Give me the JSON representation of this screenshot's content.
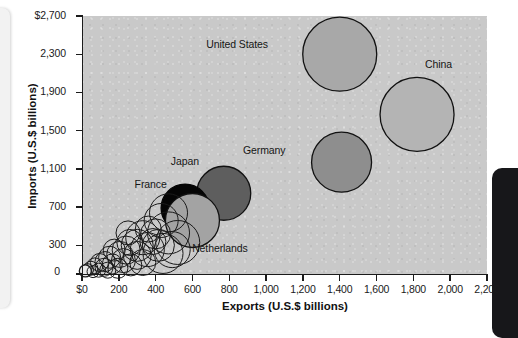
{
  "figure": {
    "plot_background_color": "#c9c9c9",
    "axis_color": "#1b1b1b"
  },
  "chart_data": {
    "type": "scatter",
    "variant": "bubble",
    "title": "",
    "xlabel": "Exports (U.S.$ billions)",
    "ylabel": "Imports (U.S.$ billions)",
    "xlim": [
      0,
      2200
    ],
    "ylim": [
      0,
      2700
    ],
    "grid": false,
    "legend": "none",
    "xticks": [
      0,
      200,
      400,
      600,
      800,
      1000,
      1200,
      1400,
      1600,
      1800,
      2000,
      2200
    ],
    "xtick_labels": [
      "$0",
      "200",
      "400",
      "600",
      "800",
      "1,000",
      "1,200",
      "1,400",
      "1,600",
      "1,800",
      "2,000",
      "2,200"
    ],
    "yticks": [
      0,
      300,
      700,
      1100,
      1500,
      1900,
      2300,
      2700
    ],
    "ytick_labels": [
      "0",
      "300",
      "700",
      "1,100",
      "1,500",
      "1,900",
      "2,300",
      "$2,700"
    ],
    "annotations": [
      {
        "text": "United States",
        "x": 1010,
        "y": 2400
      },
      {
        "text": "China",
        "x": 2010,
        "y": 2190
      },
      {
        "text": "Germany",
        "x": 1105,
        "y": 1290
      },
      {
        "text": "Japan",
        "x": 635,
        "y": 1175
      },
      {
        "text": "France",
        "x": 460,
        "y": 935
      },
      {
        "text": "Netherlands",
        "x": 900,
        "y": 265
      }
    ],
    "points": [
      {
        "name": "United States",
        "x": 1400,
        "y": 2300,
        "r": 37,
        "fill": "#a8a8a8",
        "stroke": "#111111"
      },
      {
        "name": "China",
        "x": 1820,
        "y": 1670,
        "r": 37,
        "fill": "#b4b4b4",
        "stroke": "#111111"
      },
      {
        "name": "Germany",
        "x": 1410,
        "y": 1170,
        "r": 30,
        "fill": "#8e8e8e",
        "stroke": "#111111"
      },
      {
        "name": "Japan",
        "x": 770,
        "y": 845,
        "r": 27,
        "fill": "#5e5e5e",
        "stroke": "#111111"
      },
      {
        "name": "France",
        "x": 560,
        "y": 690,
        "r": 24,
        "fill": "#050505",
        "stroke": "#050505"
      },
      {
        "name": "Netherlands",
        "x": 600,
        "y": 560,
        "r": 27,
        "fill": "#a3a3a3",
        "stroke": "#111111"
      },
      {
        "name": "other-01",
        "x": 470,
        "y": 640,
        "r": 19,
        "fill": "none",
        "stroke": "#1a1a1a"
      },
      {
        "name": "other-02",
        "x": 430,
        "y": 560,
        "r": 17,
        "fill": "none",
        "stroke": "#1a1a1a"
      },
      {
        "name": "other-03",
        "x": 470,
        "y": 430,
        "r": 21,
        "fill": "none",
        "stroke": "#1a1a1a"
      },
      {
        "name": "other-04",
        "x": 520,
        "y": 330,
        "r": 22,
        "fill": "none",
        "stroke": "#1a1a1a"
      },
      {
        "name": "other-05",
        "x": 400,
        "y": 420,
        "r": 15,
        "fill": "none",
        "stroke": "#1a1a1a"
      },
      {
        "name": "other-06",
        "x": 360,
        "y": 470,
        "r": 13,
        "fill": "none",
        "stroke": "#1a1a1a"
      },
      {
        "name": "other-07",
        "x": 330,
        "y": 380,
        "r": 17,
        "fill": "none",
        "stroke": "#1a1a1a"
      },
      {
        "name": "other-08",
        "x": 300,
        "y": 300,
        "r": 16,
        "fill": "none",
        "stroke": "#1a1a1a"
      },
      {
        "name": "other-09",
        "x": 260,
        "y": 330,
        "r": 13,
        "fill": "none",
        "stroke": "#1a1a1a"
      },
      {
        "name": "other-10",
        "x": 240,
        "y": 250,
        "r": 14,
        "fill": "none",
        "stroke": "#1a1a1a"
      },
      {
        "name": "other-11",
        "x": 205,
        "y": 205,
        "r": 13,
        "fill": "none",
        "stroke": "#1a1a1a"
      },
      {
        "name": "other-12",
        "x": 175,
        "y": 250,
        "r": 11,
        "fill": "none",
        "stroke": "#1a1a1a"
      },
      {
        "name": "other-13",
        "x": 150,
        "y": 175,
        "r": 11,
        "fill": "none",
        "stroke": "#1a1a1a"
      },
      {
        "name": "other-14",
        "x": 125,
        "y": 130,
        "r": 10,
        "fill": "none",
        "stroke": "#1a1a1a"
      },
      {
        "name": "other-15",
        "x": 95,
        "y": 120,
        "r": 9,
        "fill": "none",
        "stroke": "#1a1a1a"
      },
      {
        "name": "other-16",
        "x": 70,
        "y": 85,
        "r": 8,
        "fill": "none",
        "stroke": "#1a1a1a"
      },
      {
        "name": "other-17",
        "x": 48,
        "y": 60,
        "r": 7,
        "fill": "none",
        "stroke": "#1a1a1a"
      },
      {
        "name": "other-18",
        "x": 30,
        "y": 45,
        "r": 6,
        "fill": "none",
        "stroke": "#1a1a1a"
      },
      {
        "name": "other-19",
        "x": 18,
        "y": 32,
        "r": 6,
        "fill": "#e8e8e8",
        "stroke": "#1a1a1a"
      },
      {
        "name": "other-20",
        "x": 355,
        "y": 255,
        "r": 17,
        "fill": "none",
        "stroke": "#1a1a1a"
      },
      {
        "name": "other-21",
        "x": 300,
        "y": 195,
        "r": 14,
        "fill": "none",
        "stroke": "#1a1a1a"
      },
      {
        "name": "other-22",
        "x": 225,
        "y": 140,
        "r": 12,
        "fill": "none",
        "stroke": "#1a1a1a"
      },
      {
        "name": "other-23",
        "x": 165,
        "y": 105,
        "r": 10,
        "fill": "none",
        "stroke": "#1a1a1a"
      },
      {
        "name": "other-24",
        "x": 120,
        "y": 70,
        "r": 9,
        "fill": "none",
        "stroke": "#1a1a1a"
      },
      {
        "name": "other-25",
        "x": 415,
        "y": 300,
        "r": 16,
        "fill": "none",
        "stroke": "#1a1a1a"
      },
      {
        "name": "other-26",
        "x": 385,
        "y": 340,
        "r": 13,
        "fill": "none",
        "stroke": "#1a1a1a"
      },
      {
        "name": "other-27",
        "x": 440,
        "y": 215,
        "r": 20,
        "fill": "none",
        "stroke": "#1a1a1a"
      },
      {
        "name": "other-28",
        "x": 330,
        "y": 120,
        "r": 13,
        "fill": "none",
        "stroke": "#1a1a1a"
      },
      {
        "name": "other-29",
        "x": 265,
        "y": 95,
        "r": 11,
        "fill": "none",
        "stroke": "#1a1a1a"
      },
      {
        "name": "other-30",
        "x": 195,
        "y": 60,
        "r": 10,
        "fill": "none",
        "stroke": "#1a1a1a"
      },
      {
        "name": "other-31",
        "x": 140,
        "y": 40,
        "r": 8,
        "fill": "none",
        "stroke": "#1a1a1a"
      },
      {
        "name": "other-32",
        "x": 90,
        "y": 40,
        "r": 7,
        "fill": "none",
        "stroke": "#1a1a1a"
      },
      {
        "name": "other-33",
        "x": 60,
        "y": 25,
        "r": 6,
        "fill": "none",
        "stroke": "#1a1a1a"
      },
      {
        "name": "other-34",
        "x": 490,
        "y": 255,
        "r": 18,
        "fill": "none",
        "stroke": "#1a1a1a"
      },
      {
        "name": "other-35",
        "x": 250,
        "y": 430,
        "r": 12,
        "fill": "none",
        "stroke": "#1a1a1a"
      }
    ]
  }
}
